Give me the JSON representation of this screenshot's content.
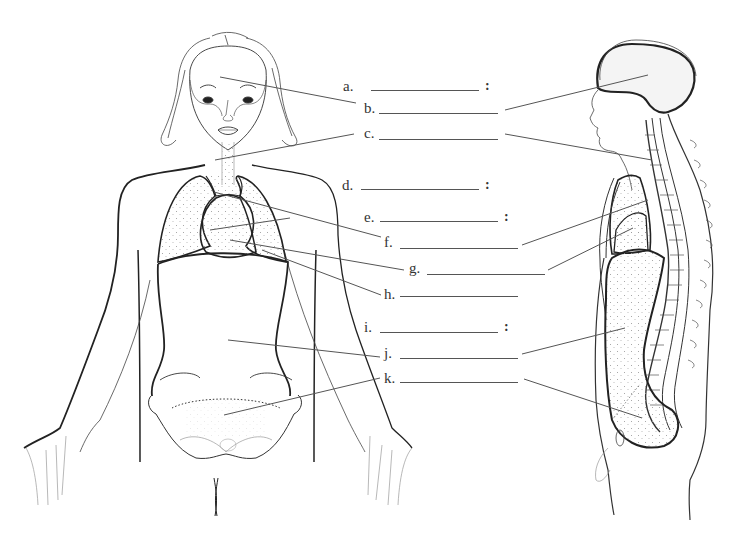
{
  "diagram": {
    "type": "anatomy-worksheet",
    "figures": [
      {
        "id": "front-view",
        "description": "Female figure, anterior view, showing lungs, heart, diaphragm, abdominal and pelvic cavities"
      },
      {
        "id": "side-view",
        "description": "Human figure, lateral view, showing cranial cavity, spinal cavity/vertebral column, thoracic and abdominopelvic cavities"
      }
    ],
    "labels": [
      {
        "letter": "a.",
        "blank": "",
        "has_colon": true,
        "x": 343,
        "y": 86,
        "line_x1": 371,
        "line_x2": 479,
        "colon_x": 485
      },
      {
        "letter": "b.",
        "blank": "",
        "has_colon": false,
        "x": 364,
        "y": 108,
        "line_x1": 379,
        "line_x2": 498
      },
      {
        "letter": "c.",
        "blank": "",
        "has_colon": false,
        "x": 364,
        "y": 133,
        "line_x1": 379,
        "line_x2": 498
      },
      {
        "letter": "d.",
        "blank": "",
        "has_colon": true,
        "x": 342,
        "y": 185,
        "line_x1": 361,
        "line_x2": 479,
        "colon_x": 485
      },
      {
        "letter": "e.",
        "blank": "",
        "has_colon": true,
        "x": 364,
        "y": 217,
        "line_x1": 380,
        "line_x2": 498,
        "colon_x": 504
      },
      {
        "letter": "f.",
        "blank": "",
        "has_colon": false,
        "x": 384,
        "y": 242,
        "line_x1": 400,
        "line_x2": 518
      },
      {
        "letter": "g.",
        "blank": "",
        "has_colon": false,
        "x": 409,
        "y": 268,
        "line_x1": 427,
        "line_x2": 545
      },
      {
        "letter": "h.",
        "blank": "",
        "has_colon": false,
        "x": 384,
        "y": 290,
        "line_x1": 400,
        "line_x2": 518
      },
      {
        "letter": "i.",
        "blank": "",
        "has_colon": true,
        "x": 364,
        "y": 327,
        "line_x1": 380,
        "line_x2": 498,
        "colon_x": 504
      },
      {
        "letter": "j.",
        "blank": "",
        "has_colon": false,
        "x": 384,
        "y": 352,
        "line_x1": 400,
        "line_x2": 518
      },
      {
        "letter": "k.",
        "blank": "",
        "has_colon": false,
        "x": 384,
        "y": 377,
        "line_x1": 400,
        "line_x2": 518
      }
    ],
    "leader_lines": [
      {
        "for": "b",
        "side": "front",
        "x1": 220,
        "y1": 77,
        "x2": 356,
        "y2": 103
      },
      {
        "for": "b",
        "side": "side",
        "x1": 505,
        "y1": 110,
        "x2": 648,
        "y2": 75
      },
      {
        "for": "c",
        "side": "front",
        "x1": 215,
        "y1": 160,
        "x2": 354,
        "y2": 134
      },
      {
        "for": "c",
        "side": "side",
        "x1": 505,
        "y1": 134,
        "x2": 652,
        "y2": 160
      },
      {
        "for": "f",
        "side": "front",
        "x1": 214,
        "y1": 192,
        "x2": 381,
        "y2": 237
      },
      {
        "for": "f",
        "side": "front",
        "x1": 210,
        "y1": 230,
        "x2": 290,
        "y2": 218
      },
      {
        "for": "f",
        "side": "side",
        "x1": 522,
        "y1": 245,
        "x2": 648,
        "y2": 200
      },
      {
        "for": "g",
        "side": "front",
        "x1": 230,
        "y1": 240,
        "x2": 404,
        "y2": 270
      },
      {
        "for": "g",
        "side": "side",
        "x1": 548,
        "y1": 270,
        "x2": 633,
        "y2": 228
      },
      {
        "for": "h",
        "side": "front",
        "x1": 262,
        "y1": 250,
        "x2": 381,
        "y2": 295
      },
      {
        "for": "j",
        "side": "front",
        "x1": 228,
        "y1": 340,
        "x2": 380,
        "y2": 357
      },
      {
        "for": "j",
        "side": "side",
        "x1": 522,
        "y1": 354,
        "x2": 625,
        "y2": 328
      },
      {
        "for": "k",
        "side": "front",
        "x1": 224,
        "y1": 415,
        "x2": 380,
        "y2": 378
      },
      {
        "for": "k",
        "side": "side",
        "x1": 524,
        "y1": 379,
        "x2": 642,
        "y2": 418
      }
    ],
    "colors": {
      "background": "#ffffff",
      "outline": "#222222",
      "leader": "#555555",
      "text": "#333333",
      "stipple": "#9a9a9a"
    }
  }
}
